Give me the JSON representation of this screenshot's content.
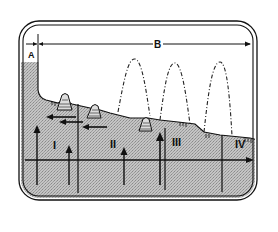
{
  "diagram": {
    "type": "cross-section",
    "colors": {
      "ink": "#111111",
      "shade": "#b8b8b8",
      "background": "#ffffff"
    },
    "dimension_labels": {
      "a": "A",
      "b": "B"
    },
    "zone_labels": [
      "I",
      "II",
      "III",
      "IV"
    ],
    "features": {
      "volcano_count": 3,
      "dashed_arc_count": 3,
      "horizontal_arrows_count": 3,
      "vertical_up_arrows_count": 4
    }
  }
}
